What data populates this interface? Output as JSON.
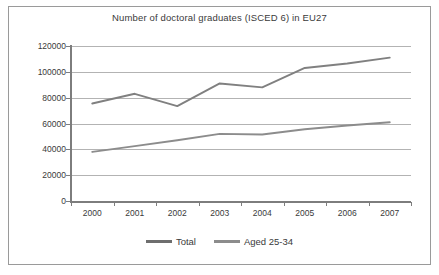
{
  "chart_data": {
    "type": "line",
    "title": "Number of doctoral graduates (ISCED 6) in EU27",
    "xlabel": "",
    "ylabel": "",
    "categories": [
      "2000",
      "2001",
      "2002",
      "2003",
      "2004",
      "2005",
      "2006",
      "2007"
    ],
    "x": [
      2000,
      2001,
      2002,
      2003,
      2004,
      2005,
      2006,
      2007
    ],
    "ylim": [
      0,
      120000
    ],
    "yticks": [
      0,
      20000,
      40000,
      60000,
      80000,
      100000,
      120000
    ],
    "ytick_labels": [
      "0",
      "20000",
      "40000",
      "60000",
      "80000",
      "100000",
      "120000"
    ],
    "grid": true,
    "legend_position": "bottom",
    "series": [
      {
        "name": "Total",
        "color": "#808080",
        "values": [
          75500,
          83000,
          73500,
          91000,
          88000,
          103000,
          106500,
          111000
        ]
      },
      {
        "name": "Aged 25-34",
        "color": "#8c8c8c",
        "values": [
          38000,
          42500,
          47000,
          52000,
          51500,
          55500,
          58500,
          61000
        ]
      }
    ]
  },
  "legend": {
    "items": [
      {
        "label": "Total",
        "color": "#6e6e6e"
      },
      {
        "label": "Aged 25-34",
        "color": "#8c8c8c"
      }
    ]
  },
  "frame": {
    "border_color": "#9a9a9a",
    "background": "#ffffff",
    "gridline_color": "#b3b3b3",
    "axis_color": "#7d7d7d",
    "text_color": "#3a3a3a"
  }
}
